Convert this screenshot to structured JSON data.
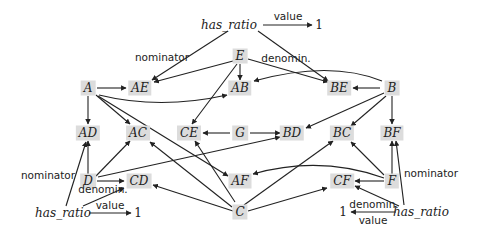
{
  "diagram": {
    "nodes": {
      "A": "A",
      "AE": "AE",
      "E": "E",
      "AB": "AB",
      "BE": "BE",
      "B": "B",
      "AD": "AD",
      "AC": "AC",
      "CE": "CE",
      "G": "G",
      "BD": "BD",
      "BC": "BC",
      "BF": "BF",
      "D": "D",
      "CD": "CD",
      "AF": "AF",
      "CF": "CF",
      "F": "F",
      "C": "C"
    },
    "ratios": {
      "top": {
        "name": "has_ratio",
        "value_label": "value",
        "value": "1",
        "nominator_label": "nominator",
        "denominator_label": "denomin."
      },
      "left": {
        "name": "has_ratio",
        "value_label": "value",
        "value": "1",
        "nominator_label": "nominator",
        "denominator_label": "denomin."
      },
      "right": {
        "name": "has_ratio",
        "value_label": "value",
        "value": "1",
        "nominator_label": "nominator",
        "denominator_label": "denomin."
      }
    },
    "edges": [
      [
        "A",
        "AE"
      ],
      [
        "A",
        "AD"
      ],
      [
        "A",
        "AC"
      ],
      [
        "A",
        "AB"
      ],
      [
        "A",
        "AF"
      ],
      [
        "E",
        "AE"
      ],
      [
        "E",
        "AB"
      ],
      [
        "E",
        "BE"
      ],
      [
        "E",
        "CE"
      ],
      [
        "B",
        "BE"
      ],
      [
        "B",
        "AB"
      ],
      [
        "B",
        "BF"
      ],
      [
        "B",
        "BD"
      ],
      [
        "B",
        "BC"
      ],
      [
        "G",
        "CE"
      ],
      [
        "G",
        "BD"
      ],
      [
        "D",
        "AD"
      ],
      [
        "D",
        "AC"
      ],
      [
        "D",
        "CD"
      ],
      [
        "D",
        "BD"
      ],
      [
        "C",
        "AC"
      ],
      [
        "C",
        "CE"
      ],
      [
        "C",
        "CD"
      ],
      [
        "C",
        "BC"
      ],
      [
        "C",
        "CF"
      ],
      [
        "F",
        "CF"
      ],
      [
        "F",
        "BC"
      ],
      [
        "F",
        "BF"
      ],
      [
        "F",
        "AF"
      ]
    ]
  }
}
